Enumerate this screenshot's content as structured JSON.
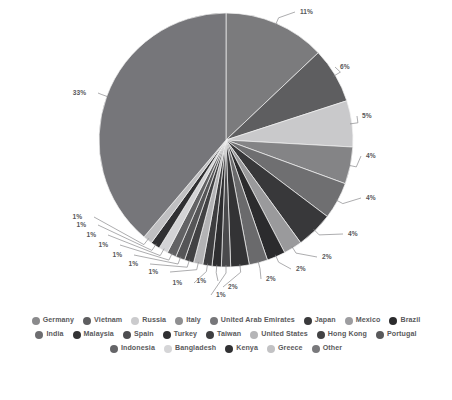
{
  "chart_data": {
    "type": "pie",
    "title": "",
    "legend_position": "bottom",
    "grid": false,
    "start_angle_deg": 0,
    "direction": "clockwise",
    "categories": [
      "Germany",
      "Vietnam",
      "Russia",
      "Italy",
      "United Arab Emirates",
      "Japan",
      "Mexico",
      "Brazil",
      "India",
      "Malaysia",
      "Spain",
      "Turkey",
      "Taiwan",
      "United States",
      "Hong Kong",
      "Portugal",
      "Indonesia",
      "Bangladesh",
      "Kenya",
      "Greece",
      "Other"
    ],
    "values": [
      11,
      6,
      5,
      4,
      4,
      4,
      2,
      2,
      2,
      2,
      1,
      1,
      1,
      1,
      1,
      1,
      1,
      1,
      1,
      1,
      33
    ],
    "value_labels": [
      "11%",
      "6%",
      "5%",
      "4%",
      "4%",
      "4%",
      "2%",
      "2%",
      "2%",
      "2%",
      "1%",
      "1%",
      "1%",
      "1%",
      "1%",
      "1%",
      "1%",
      "1%",
      "1%",
      "1%",
      "33%"
    ],
    "colors": [
      "#7b7b7d",
      "#5e5e60",
      "#c9c9cb",
      "#848486",
      "#6f6f71",
      "#38383a",
      "#9a9a9c",
      "#2b2b2d",
      "#6a6a6c",
      "#333335",
      "#4a4a4c",
      "#2e2e30",
      "#3d3d3f",
      "#b3b3b5",
      "#414143",
      "#555557",
      "#626264",
      "#d3d3d5",
      "#303032",
      "#c0c0c2",
      "#76767a"
    ],
    "xlabel": "",
    "ylabel": ""
  },
  "legend": {
    "rows": [
      [
        {
          "label": "Germany",
          "color": "#8a8a8c"
        },
        {
          "label": "Vietnam",
          "color": "#5e5e60"
        },
        {
          "label": "Russia",
          "color": "#cbcbcd"
        },
        {
          "label": "Italy",
          "color": "#8f8f91"
        },
        {
          "label": "United Arab Emirates",
          "color": "#77777a"
        },
        {
          "label": "Japan",
          "color": "#3a3a3c"
        },
        {
          "label": "Mexico",
          "color": "#9d9da0"
        },
        {
          "label": "Brazil",
          "color": "#2b2b2d"
        }
      ],
      [
        {
          "label": "India",
          "color": "#6d6d70"
        },
        {
          "label": "Malaysia",
          "color": "#333335"
        },
        {
          "label": "Spain",
          "color": "#4d4d50"
        },
        {
          "label": "Turkey",
          "color": "#2f2f31"
        },
        {
          "label": "Taiwan",
          "color": "#3f3f41"
        },
        {
          "label": "United States",
          "color": "#b5b5b7"
        },
        {
          "label": "Hong Kong",
          "color": "#424244"
        },
        {
          "label": "Portugal",
          "color": "#59595b"
        }
      ],
      [
        {
          "label": "Indonesia",
          "color": "#656568"
        },
        {
          "label": "Bangladesh",
          "color": "#d5d5d7"
        },
        {
          "label": "Kenya",
          "color": "#313133"
        },
        {
          "label": "Greece",
          "color": "#c2c2c4"
        },
        {
          "label": "Other",
          "color": "#79797c"
        }
      ]
    ]
  }
}
